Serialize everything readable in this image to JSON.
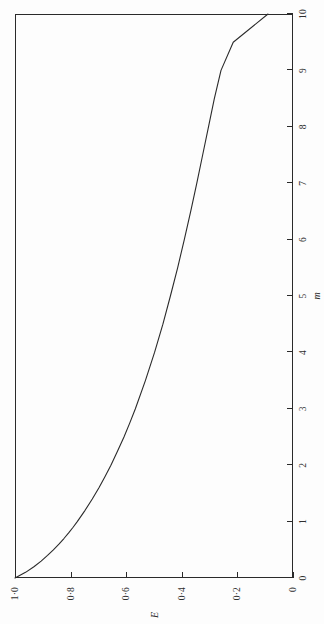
{
  "figure": {
    "background_color": "#fdfdfd",
    "ink_color": "#2a2a2a",
    "page_rotation_degrees": -90
  },
  "chart_data": {
    "type": "line",
    "title": "",
    "subtitle": "",
    "xlabel": "m",
    "ylabel": "E",
    "xlim": [
      0,
      10
    ],
    "ylim": [
      0,
      1.0
    ],
    "grid": false,
    "legend": null,
    "xticks": [
      0,
      1,
      2,
      3,
      4,
      5,
      6,
      7,
      8,
      9,
      10
    ],
    "xtick_labels": [
      "0",
      "1",
      "2",
      "3",
      "4",
      "5",
      "6",
      "7",
      "8",
      "9",
      "10"
    ],
    "yticks": [
      0,
      0.2,
      0.4,
      0.6,
      0.8,
      1.0
    ],
    "ytick_labels": [
      "0",
      "0·2",
      "0·4",
      "0·6",
      "0·8",
      "1·0"
    ],
    "series": [
      {
        "name": "E(m)",
        "x": [
          0,
          0.1,
          0.2,
          0.3,
          0.4,
          0.5,
          0.6,
          0.7,
          0.8,
          0.9,
          1.0,
          1.2,
          1.4,
          1.6,
          1.8,
          2.0,
          2.25,
          2.5,
          2.75,
          3.0,
          3.5,
          4.0,
          4.5,
          5.0,
          5.5,
          6.0,
          6.5,
          7.0,
          7.5,
          8.0,
          8.5,
          9.0,
          9.5,
          10.0
        ],
        "values": [
          1.0,
          0.962,
          0.932,
          0.906,
          0.883,
          0.862,
          0.842,
          0.824,
          0.807,
          0.791,
          0.776,
          0.748,
          0.722,
          0.698,
          0.676,
          0.655,
          0.631,
          0.608,
          0.587,
          0.567,
          0.531,
          0.498,
          0.468,
          0.441,
          0.415,
          0.391,
          0.368,
          0.346,
          0.325,
          0.304,
          0.283,
          0.259,
          0.215,
          0.09
        ]
      }
    ]
  }
}
